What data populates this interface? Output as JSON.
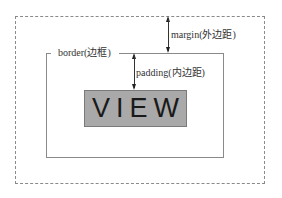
{
  "diagram": {
    "margin": {
      "label": "margin(外边距)",
      "style": "dashed",
      "color": "#8a8a8a"
    },
    "border": {
      "label": "border(边框)",
      "style": "solid",
      "color": "#8a8a8a"
    },
    "padding": {
      "label": "padding(内边距)"
    },
    "view": {
      "label": "VIEW",
      "fill": "#a9a9a9",
      "text_color": "#1a1a1a"
    }
  }
}
